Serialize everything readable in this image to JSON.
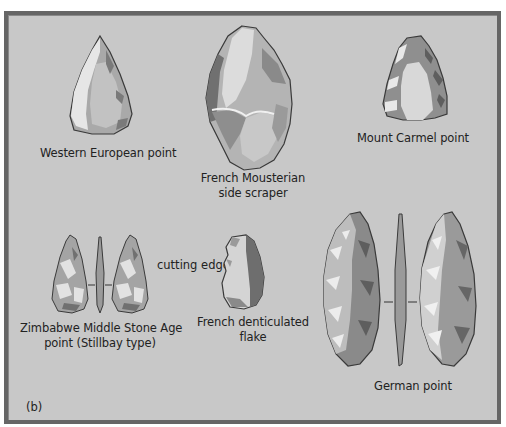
{
  "figure": {
    "panel_label": "(b)",
    "colors": {
      "background": "#c8c8c8",
      "frame_border": "#666666",
      "text": "#222222",
      "stone_outline": "#3a3a3a",
      "stone_light": "#e6e6e6",
      "stone_mid": "#a9a9a9",
      "stone_dark": "#6e6e6e"
    },
    "artifacts": [
      {
        "id": "western-european-point",
        "label_lines": [
          "Western European point"
        ]
      },
      {
        "id": "french-mousterian-side-scraper",
        "label_lines": [
          "French Mousterian",
          "side scraper"
        ]
      },
      {
        "id": "mount-carmel-point",
        "label_lines": [
          "Mount Carmel point"
        ]
      },
      {
        "id": "zimbabwe-middle-stone-age-point",
        "label_lines": [
          "Zimbabwe Middle Stone Age",
          "point (Stillbay type)"
        ]
      },
      {
        "id": "french-denticulated-flake",
        "label_lines": [
          "French denticulated",
          "flake"
        ],
        "annotation": "cutting edge"
      },
      {
        "id": "german-point",
        "label_lines": [
          "German point"
        ]
      }
    ]
  }
}
